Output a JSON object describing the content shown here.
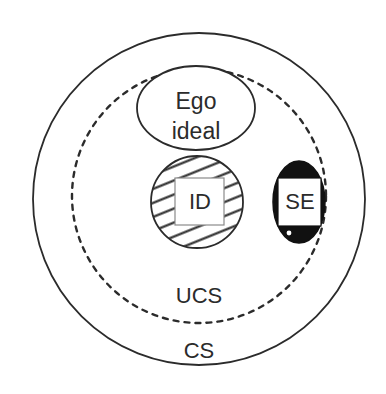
{
  "diagram": {
    "type": "nested-set-venn",
    "background_color": "#ffffff",
    "stroke_color": "#2b2b2b",
    "fill_black": "#111111",
    "regions": [
      {
        "id": "cs",
        "label": "CS",
        "shape": "circle",
        "stroke": "solid",
        "cx": 199,
        "cy": 199,
        "r": 166,
        "label_x": 199,
        "label_y": 352,
        "fill": "none"
      },
      {
        "id": "ucs",
        "label": "UCS",
        "shape": "circle",
        "stroke": "dashed",
        "cx": 199,
        "cy": 196,
        "r": 127,
        "label_x": 199,
        "label_y": 297,
        "fill": "none"
      },
      {
        "id": "ego-ideal",
        "label_line1": "Ego",
        "label_line2": "ideal",
        "shape": "ellipse",
        "stroke": "solid",
        "cx": 196,
        "cy": 108,
        "rx": 59,
        "ry": 42,
        "fill": "#ffffff"
      },
      {
        "id": "id",
        "label": "ID",
        "shape": "circle-hatched",
        "stroke": "solid",
        "cx": 197,
        "cy": 202,
        "r": 47,
        "hatch_angle_deg": 22,
        "hatch_spacing": 13,
        "box_x": 175,
        "box_y": 178,
        "box_w": 49,
        "box_h": 47,
        "fill": "#ffffff"
      },
      {
        "id": "se",
        "label": "SE",
        "shape": "ellipse-filled",
        "stroke": "solid",
        "cx": 299,
        "cy": 202,
        "rx": 26,
        "ry": 41,
        "fill": "#111111",
        "box_x": 278,
        "box_y": 178,
        "box_w": 43,
        "box_h": 48,
        "dot_cx": 289,
        "dot_cy": 233,
        "dot_r": 2.4
      }
    ]
  },
  "labels": {
    "cs": "CS",
    "ucs": "UCS",
    "ego_ideal_line1": "Ego",
    "ego_ideal_line2": "ideal",
    "id": "ID",
    "se": "SE"
  }
}
